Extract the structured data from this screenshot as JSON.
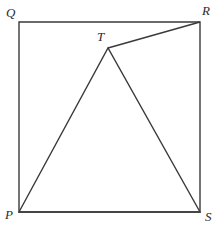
{
  "figure": {
    "kind": "geometry-diagram",
    "width": 219,
    "height": 230,
    "background_color": "#ffffff",
    "stroke_color": "#3a3a3a",
    "stroke_width": 1.4,
    "label_color": "#2b2b2b"
  },
  "points": {
    "Q": {
      "label": "Q",
      "x": 19,
      "y": 22,
      "label_x": 6,
      "label_y": 6
    },
    "R": {
      "label": "R",
      "x": 200,
      "y": 22,
      "label_x": 202,
      "label_y": 4
    },
    "P": {
      "label": "P",
      "x": 19,
      "y": 212,
      "label_x": 5,
      "label_y": 208
    },
    "S": {
      "label": "S",
      "x": 200,
      "y": 212,
      "label_x": 205,
      "label_y": 210
    },
    "T": {
      "label": "T",
      "x": 108,
      "y": 48,
      "label_x": 97,
      "label_y": 30
    }
  },
  "shapes": {
    "square": {
      "name": "square-PQRS",
      "vertices": "19,22 200,22 200,212 19,212"
    },
    "triangle": {
      "name": "triangle-PTS",
      "vertices": "19,212 108,48 200,212"
    },
    "segment_TR": {
      "name": "segment-TR",
      "x1": 108,
      "y1": 48,
      "x2": 200,
      "y2": 22
    }
  },
  "chart_data": {
    "type": "scatter",
    "title": "",
    "xlabel": "",
    "ylabel": "",
    "labels": [
      "Q",
      "R",
      "T",
      "P",
      "S"
    ],
    "x": [
      19,
      200,
      108,
      19,
      200
    ],
    "y": [
      22,
      22,
      48,
      212,
      212
    ],
    "edges": [
      [
        "Q",
        "R"
      ],
      [
        "R",
        "S"
      ],
      [
        "S",
        "P"
      ],
      [
        "P",
        "Q"
      ],
      [
        "P",
        "T"
      ],
      [
        "T",
        "S"
      ],
      [
        "T",
        "R"
      ]
    ],
    "xlim": [
      0,
      219
    ],
    "ylim": [
      0,
      230
    ],
    "grid": false,
    "legend": "none"
  }
}
